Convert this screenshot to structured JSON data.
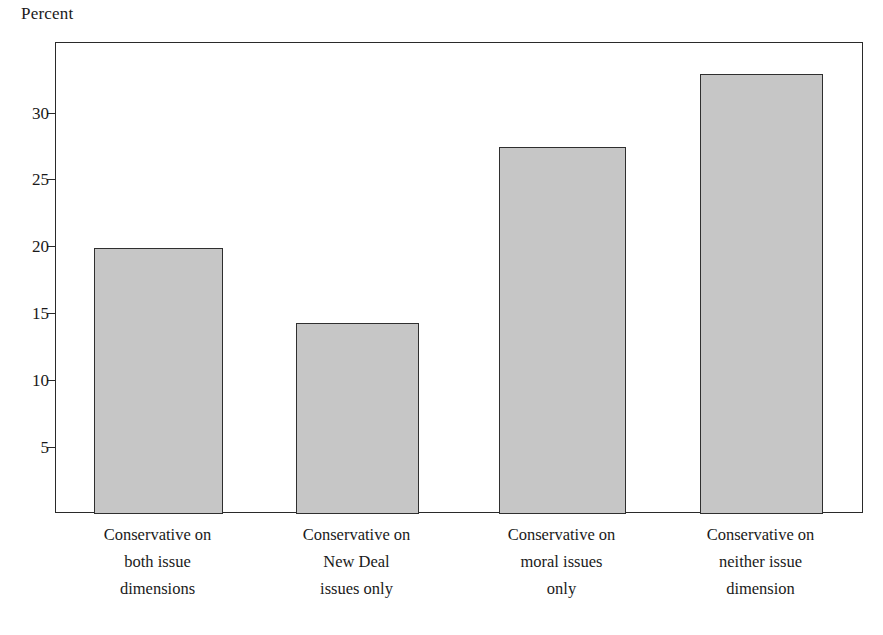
{
  "chart_data": {
    "type": "bar",
    "title": "",
    "subtitle": "",
    "xlabel": "",
    "ylabel": "Percent",
    "ylim": [
      0,
      35.2
    ],
    "grid": false,
    "legend": null,
    "categories": [
      "Conservative on both issue dimensions",
      "Conservative on New Deal issues only",
      "Conservative on moral issues only",
      "Conservative on neither issue dimension"
    ],
    "category_lines": [
      [
        "Conservative on",
        "both issue",
        "dimensions"
      ],
      [
        "Conservative on",
        "New Deal",
        "issues only"
      ],
      [
        "Conservative on",
        "moral issues",
        "only"
      ],
      [
        "Conservative on",
        "neither issue",
        "dimension"
      ]
    ],
    "values": [
      19.9,
      14.3,
      27.4,
      32.9
    ],
    "yticks": [
      5,
      10,
      15,
      20,
      25,
      30
    ],
    "ytick_labels": [
      "5",
      "10",
      "15",
      "20",
      "25",
      "30"
    ],
    "bar_color": "#c6c6c6",
    "bar_edge_color": "#2f2f2f",
    "axis_color": "#2a2a2a",
    "background_color": "#ffffff"
  }
}
